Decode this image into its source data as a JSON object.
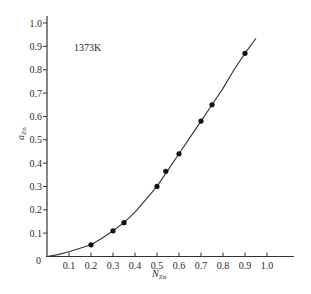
{
  "chart_data": {
    "type": "line",
    "title": "",
    "annotation": "1373K",
    "xlabel": "N_Zn",
    "xlabel_main": "N",
    "xlabel_sub": "Zn",
    "ylabel": "a_Zn",
    "ylabel_main": "a",
    "ylabel_sub": "Zn",
    "xlim": [
      0,
      1.1
    ],
    "ylim": [
      0,
      1.0
    ],
    "grid": false,
    "legend": null,
    "x_ticks": [
      "0.1",
      "0.2",
      "0.3",
      "0.4",
      "0.5",
      "0.6",
      "0.7",
      "0.8",
      "0.9",
      "1.0"
    ],
    "y_ticks": [
      "0.1",
      "0.2",
      "0.3",
      "0.4",
      "0.5",
      "0.6",
      "0.7",
      "0.8",
      "0.9",
      "1.0"
    ],
    "origin_label": "0",
    "series": [
      {
        "name": "measured points",
        "kind": "scatter",
        "x": [
          0.2,
          0.3,
          0.35,
          0.5,
          0.54,
          0.6,
          0.7,
          0.75,
          0.9
        ],
        "y": [
          0.05,
          0.11,
          0.145,
          0.3,
          0.365,
          0.44,
          0.58,
          0.65,
          0.87
        ]
      },
      {
        "name": "fitted curve",
        "kind": "line",
        "x": [
          0.0,
          0.05,
          0.1,
          0.15,
          0.2,
          0.25,
          0.3,
          0.35,
          0.4,
          0.45,
          0.5,
          0.55,
          0.6,
          0.65,
          0.7,
          0.75,
          0.8,
          0.85,
          0.9,
          0.95
        ],
        "y": [
          0.0,
          0.008,
          0.02,
          0.035,
          0.05,
          0.078,
          0.11,
          0.145,
          0.19,
          0.245,
          0.3,
          0.37,
          0.44,
          0.51,
          0.58,
          0.65,
          0.72,
          0.8,
          0.87,
          0.935
        ]
      }
    ]
  }
}
